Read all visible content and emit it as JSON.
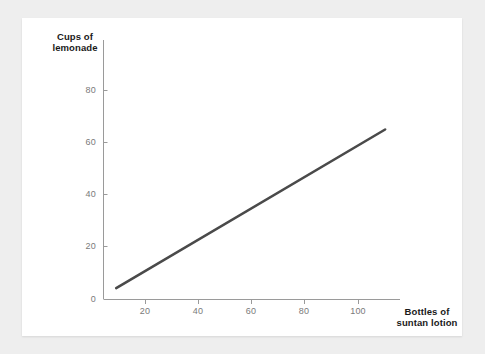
{
  "chart_data": {
    "type": "line",
    "title": "",
    "subtitle": "",
    "xlabel": "Bottles of\nsuntan lotion",
    "ylabel": "Cups of\nlemonade",
    "xlim": [
      0,
      118
    ],
    "ylim": [
      0,
      90
    ],
    "grid": false,
    "legend": null,
    "x_ticks": [
      "20",
      "40",
      "60",
      "80",
      "100"
    ],
    "x_tick_values": [
      20,
      40,
      60,
      80,
      100
    ],
    "y_ticks": [
      "0",
      "20",
      "40",
      "60",
      "80"
    ],
    "y_tick_values": [
      0,
      20,
      40,
      60,
      80
    ],
    "series": [
      {
        "name": "lemonade vs suntan lotion",
        "color": "#4a4a4a",
        "x": [
          9,
          110
        ],
        "values": [
          4,
          65
        ],
        "points": [
          [
            9,
            4
          ],
          [
            110,
            65
          ]
        ]
      }
    ],
    "annotations": []
  },
  "axes": {
    "axis_color": "#9a9a9a",
    "tick_color": "#9a9a9a",
    "tick_label_color": "#7a7a7a",
    "axis_label_color": "#1a1a1a"
  },
  "canvas": {
    "page_background": "#eeeeee",
    "card_background": "#ffffff"
  }
}
